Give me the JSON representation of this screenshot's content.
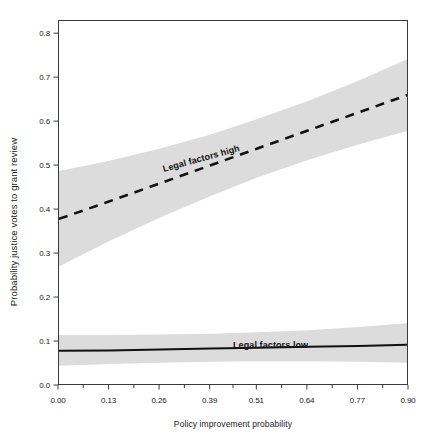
{
  "chart_data": {
    "type": "line",
    "title": "",
    "xlabel": "Policy improvement probability",
    "ylabel": "Probability justice votes to grant review",
    "xlim": [
      0.0,
      0.9
    ],
    "ylim": [
      0.0,
      0.83
    ],
    "grid": false,
    "legend_position": "inline-annotations",
    "xticks": [
      0.0,
      0.13,
      0.26,
      0.39,
      0.51,
      0.64,
      0.77,
      0.9
    ],
    "xticklabels": [
      "0.00",
      "0.13",
      "0.26",
      "0.39",
      "0.51",
      "0.64",
      "0.77",
      "0.90"
    ],
    "xminorticks": [
      0.065,
      0.195,
      0.325,
      0.45,
      0.575,
      0.705,
      0.835
    ],
    "yticks": [
      0.0,
      0.1,
      0.2,
      0.3,
      0.4,
      0.5,
      0.6,
      0.7,
      0.8
    ],
    "yticklabels": [
      "0.0",
      "0.1",
      "0.2",
      "0.3",
      "0.4",
      "0.5",
      "0.6",
      "0.7",
      "0.8"
    ],
    "series": [
      {
        "name": "Legal factors high",
        "style": "dashed",
        "color": "#111111",
        "label_text": "Legal factors high",
        "x": [
          0.0,
          0.13,
          0.26,
          0.39,
          0.51,
          0.64,
          0.77,
          0.9
        ],
        "values": [
          0.38,
          0.42,
          0.461,
          0.502,
          0.54,
          0.581,
          0.622,
          0.663
        ],
        "band_lower": [
          0.272,
          0.33,
          0.383,
          0.432,
          0.474,
          0.514,
          0.549,
          0.581
        ],
        "band_upper": [
          0.489,
          0.512,
          0.54,
          0.572,
          0.607,
          0.648,
          0.694,
          0.745
        ]
      },
      {
        "name": "Legal factors low",
        "style": "solid",
        "color": "#111111",
        "label_text": "Legal factors low",
        "x": [
          0.0,
          0.13,
          0.26,
          0.39,
          0.51,
          0.64,
          0.77,
          0.9
        ],
        "values": [
          0.08,
          0.081,
          0.083,
          0.085,
          0.087,
          0.089,
          0.091,
          0.094
        ],
        "band_lower": [
          0.046,
          0.05,
          0.053,
          0.055,
          0.056,
          0.056,
          0.055,
          0.053
        ],
        "band_upper": [
          0.116,
          0.116,
          0.117,
          0.119,
          0.122,
          0.127,
          0.134,
          0.143
        ]
      }
    ],
    "band_color": "#dcdcdc",
    "frame_color": "#3a3a3a",
    "background": "#ffffff"
  }
}
